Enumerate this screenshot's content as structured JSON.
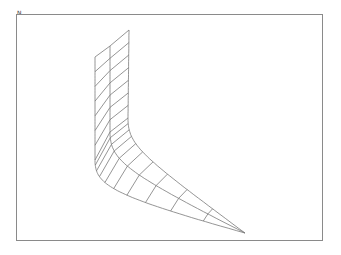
{
  "figure": {
    "corner_label": "N",
    "line_color": "#7a7a7a",
    "frame_color": "#8a8a8a",
    "background": "#ffffff"
  },
  "mesh": {
    "columns": 3,
    "rows": 16,
    "tip": [
      245,
      233
    ]
  }
}
